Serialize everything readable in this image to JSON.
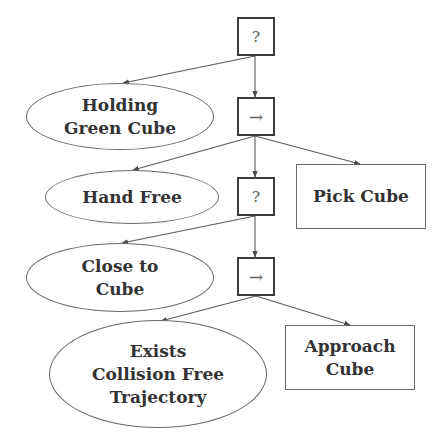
{
  "diagram": {
    "type": "behavior-tree",
    "colors": {
      "stroke": "#5a5a5a",
      "control_border": "#3a3a3a",
      "text": "#333333",
      "background": "#ffffff"
    },
    "nodes": {
      "root_fallback": {
        "kind": "fallback",
        "symbol": "?"
      },
      "sequence_1": {
        "kind": "sequence",
        "symbol": "→"
      },
      "holding_green_cube": {
        "kind": "condition",
        "label": "Holding\nGreen Cube"
      },
      "hand_free": {
        "kind": "condition",
        "label": "Hand Free"
      },
      "fallback_2": {
        "kind": "fallback",
        "symbol": "?"
      },
      "pick_cube": {
        "kind": "action",
        "label": "Pick Cube"
      },
      "close_to_cube": {
        "kind": "condition",
        "label": "Close to\nCube"
      },
      "sequence_2": {
        "kind": "sequence",
        "symbol": "→"
      },
      "exists_collision_free_trajectory": {
        "kind": "condition",
        "label": "Exists\nCollision Free\nTrajectory"
      },
      "approach_cube": {
        "kind": "action",
        "label": "Approach\nCube"
      }
    },
    "edges": [
      {
        "from": "root_fallback",
        "to": "holding_green_cube"
      },
      {
        "from": "root_fallback",
        "to": "sequence_1"
      },
      {
        "from": "sequence_1",
        "to": "hand_free"
      },
      {
        "from": "sequence_1",
        "to": "fallback_2"
      },
      {
        "from": "sequence_1",
        "to": "pick_cube"
      },
      {
        "from": "fallback_2",
        "to": "close_to_cube"
      },
      {
        "from": "fallback_2",
        "to": "sequence_2"
      },
      {
        "from": "sequence_2",
        "to": "exists_collision_free_trajectory"
      },
      {
        "from": "sequence_2",
        "to": "approach_cube"
      }
    ]
  }
}
